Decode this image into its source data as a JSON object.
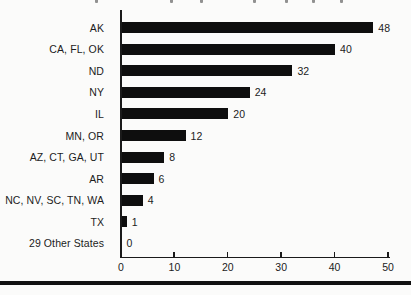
{
  "chart_data": {
    "type": "bar",
    "orientation": "horizontal",
    "title": "",
    "xlabel": "",
    "ylabel": "",
    "categories": [
      "AK",
      "CA, FL, OK",
      "ND",
      "NY",
      "IL",
      "MN, OR",
      "AZ, CT, GA, UT",
      "AR",
      "NC, NV, SC, TN, WA",
      "TX",
      "29 Other States"
    ],
    "values": [
      48,
      40,
      32,
      24,
      20,
      12,
      8,
      6,
      4,
      1,
      0
    ],
    "value_labels": [
      "48",
      "40",
      "32",
      "24",
      "20",
      "12",
      "8",
      "6",
      "4",
      "1",
      "0"
    ],
    "xlim": [
      0,
      50
    ],
    "x_ticks": [
      0,
      10,
      20,
      30,
      40,
      50
    ],
    "grid": false,
    "legend": false,
    "bar_color": "#0e0e0e",
    "axis_color": "#1a1a1a",
    "text_color": "#1c1c1c",
    "background_color": "#fbfbfa"
  },
  "decor": {
    "bottom_rule_color": "#111111",
    "top_fragment_x": [
      95,
      170,
      200,
      253,
      285,
      312,
      340
    ]
  },
  "layout_numbers": {
    "px_per_unit": 5.34
  }
}
